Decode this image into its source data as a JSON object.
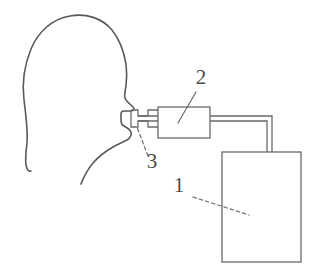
{
  "figure": {
    "kind": "technical-line-diagram",
    "background_color": "#ffffff",
    "line_color": "#5a5a5a",
    "label_color": "#4a4a4a",
    "width": 326,
    "height": 279
  },
  "callouts": [
    {
      "id": "callout-2",
      "number": "2",
      "target": "inline-device-box",
      "text_x": 201,
      "text_y": 84,
      "leader_style": "solid",
      "leader": [
        [
          196,
          92
        ],
        [
          178,
          123
        ]
      ]
    },
    {
      "id": "callout-3",
      "number": "3",
      "target": "mouthpiece",
      "text_x": 152,
      "text_y": 168,
      "leader_style": "dashed",
      "leader": [
        [
          148,
          156
        ],
        [
          137,
          127
        ]
      ]
    },
    {
      "id": "callout-1",
      "number": "1",
      "target": "collection-container",
      "text_x": 179,
      "text_y": 192,
      "leader_style": "dashed",
      "leader": [
        [
          193,
          197
        ],
        [
          249,
          215
        ]
      ]
    }
  ],
  "parts": {
    "head": {
      "name": "human-head-profile",
      "description": "left-facing profile outline of a head with forehead, nose, lips, chin and neck"
    },
    "mouthpiece": {
      "name": "mouthpiece",
      "number": "3",
      "description": "small flanged T-shaped mouthpiece held between the lips"
    },
    "device": {
      "name": "inline-device",
      "number": "2",
      "description": "rectangular inline device (filter / sensor) with tube stubs on both sides",
      "rect": [
        158,
        107,
        52,
        31
      ]
    },
    "container": {
      "name": "collection-container",
      "number": "1",
      "description": "large upright rectangular collection container / vessel",
      "rect": [
        222,
        152,
        79,
        110
      ]
    },
    "tubing": {
      "name": "connecting-tubing",
      "description": "double-line tube running right from the device then turning down into the top of the container"
    }
  }
}
